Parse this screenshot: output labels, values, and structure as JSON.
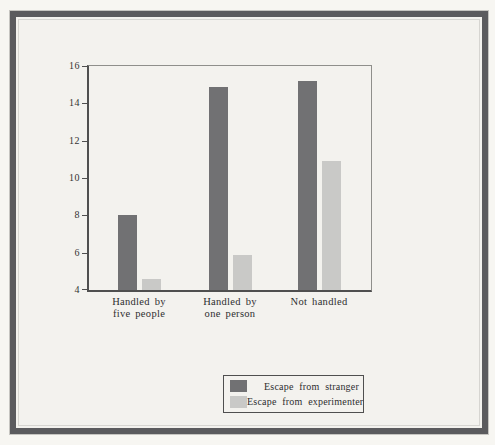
{
  "page": {
    "background": "#f3f2ee",
    "frame_color": "#5b5b5e"
  },
  "chart_data": {
    "type": "bar",
    "title": "",
    "xlabel": "",
    "ylabel": "",
    "ylim": [
      4,
      16
    ],
    "yticks": [
      4,
      6,
      8,
      10,
      12,
      14,
      16
    ],
    "grid": false,
    "legend_position": "below-chart-right",
    "categories": [
      {
        "lines": [
          "Handled by",
          "five people"
        ]
      },
      {
        "lines": [
          "Handled by",
          "one person"
        ]
      },
      {
        "lines": [
          "Not handled"
        ]
      }
    ],
    "series": [
      {
        "name": "Escape from stranger",
        "color": "#717173",
        "values": [
          8.0,
          14.9,
          15.2
        ]
      },
      {
        "name": "Escape from experimenter",
        "color": "#c9c9c7",
        "values": [
          4.6,
          5.9,
          10.9
        ]
      }
    ]
  }
}
